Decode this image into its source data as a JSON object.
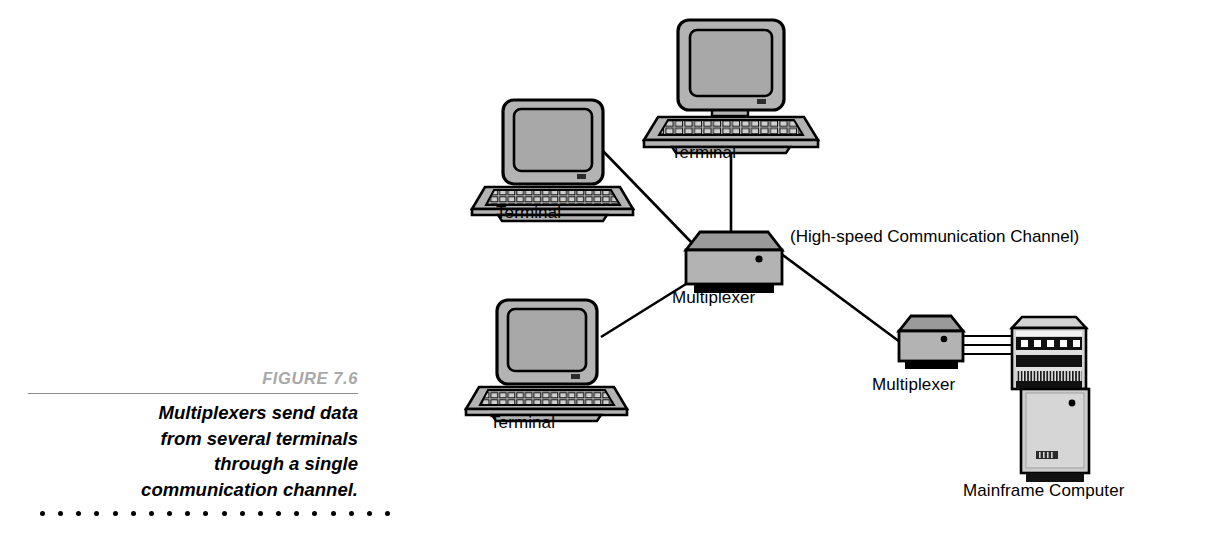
{
  "figure": {
    "number": "FIGURE 7.6",
    "caption_lines": [
      "Multiplexers send data",
      "from several terminals",
      "through a single",
      "communication channel."
    ],
    "dot_count": 20
  },
  "diagram": {
    "type": "network-topology",
    "labels": {
      "terminal_top": "Terminal",
      "terminal_left": "Terminal",
      "terminal_bottom": "Terminal",
      "multiplexer_center": "Multiplexer",
      "multiplexer_right": "Multiplexer",
      "mainframe": "Mainframe Computer",
      "channel": "(High-speed Communication Channel)"
    },
    "colors": {
      "outline": "#000000",
      "device_fill": "#b3b3b3",
      "device_top_fill": "#9a9a9a",
      "screen_fill": "#a8a8a8",
      "shadow": "#000000",
      "cabinet_fill": "#cccccc",
      "figure_number": "#a8a8a8",
      "rule": "#8c8c8c"
    },
    "nodes": [
      {
        "name": "terminal-top",
        "label": "Terminal",
        "x": 728,
        "y": 85
      },
      {
        "name": "terminal-left",
        "label": "Terminal",
        "x": 551,
        "y": 150
      },
      {
        "name": "terminal-bottom",
        "label": "Terminal",
        "x": 545,
        "y": 350
      },
      {
        "name": "multiplexer-center",
        "label": "Multiplexer",
        "x": 728,
        "y": 255
      },
      {
        "name": "multiplexer-right",
        "label": "Multiplexer",
        "x": 932,
        "y": 340
      },
      {
        "name": "mainframe",
        "label": "Mainframe Computer",
        "x": 1055,
        "y": 400
      }
    ],
    "links": [
      {
        "from": "terminal-top",
        "to": "multiplexer-center",
        "style": "single"
      },
      {
        "from": "terminal-left",
        "to": "multiplexer-center",
        "style": "single"
      },
      {
        "from": "terminal-bottom",
        "to": "multiplexer-center",
        "style": "single"
      },
      {
        "from": "multiplexer-center",
        "to": "multiplexer-right",
        "style": "single"
      },
      {
        "from": "multiplexer-right",
        "to": "mainframe",
        "style": "triple-cable"
      }
    ]
  }
}
